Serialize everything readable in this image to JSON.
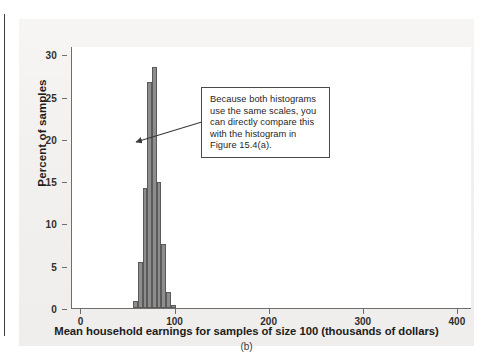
{
  "figure": {
    "caption": "(b)",
    "annotation": {
      "text": "Because both histograms use the same scales, you can directly compare this with the histogram in Figure 15.4(a).",
      "lines": [
        "Because both histograms",
        "use the same scales, you",
        "can directly compare this",
        "with the histogram in",
        "Figure 15.4(a)."
      ]
    }
  },
  "colors": {
    "bar_fill": "#8d8d8d",
    "bar_stroke": "#5a5a5a",
    "axis": "#6d6d6d",
    "plot_background": "#ffffff",
    "page_background": "#f3f2f0",
    "text": "#1d1d1d"
  },
  "chart_data": {
    "type": "bar",
    "title": "",
    "subtitle": "",
    "xlabel": "Mean household earnings for samples of size 100 (thousands of dollars)",
    "ylabel": "Percent of samples",
    "xlim": [
      -10,
      415
    ],
    "ylim": [
      0,
      31
    ],
    "xticks": [
      0,
      100,
      200,
      300,
      400
    ],
    "yticks": [
      0,
      5,
      10,
      15,
      20,
      25,
      30
    ],
    "xtick_labels": [
      "0",
      "100",
      "200",
      "300",
      "400"
    ],
    "ytick_labels": [
      "0",
      "5",
      "10",
      "15",
      "20",
      "25",
      "30"
    ],
    "grid": false,
    "legend": null,
    "bin_width": 5,
    "bins": [
      {
        "x0": 55,
        "x1": 60,
        "value": 0.8
      },
      {
        "x0": 60,
        "x1": 65,
        "value": 5.4
      },
      {
        "x0": 65,
        "x1": 70,
        "value": 14.2
      },
      {
        "x0": 70,
        "x1": 75,
        "value": 26.8
      },
      {
        "x0": 75,
        "x1": 80,
        "value": 28.5
      },
      {
        "x0": 80,
        "x1": 85,
        "value": 14.9
      },
      {
        "x0": 85,
        "x1": 90,
        "value": 7.6
      },
      {
        "x0": 90,
        "x1": 95,
        "value": 1.9
      },
      {
        "x0": 95,
        "x1": 100,
        "value": 0.4
      }
    ],
    "categories": [
      "55-60",
      "60-65",
      "65-70",
      "70-75",
      "75-80",
      "80-85",
      "85-90",
      "90-95",
      "95-100"
    ],
    "values": [
      0.8,
      5.4,
      14.2,
      26.8,
      28.5,
      14.9,
      7.6,
      1.9,
      0.4
    ],
    "annotations": [
      {
        "text": "Because both histograms use the same scales, you can directly compare this with the histogram in Figure 15.4(a).",
        "points_to": "histogram-peak"
      }
    ]
  }
}
